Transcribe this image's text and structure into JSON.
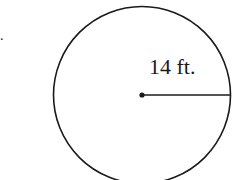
{
  "diagram": {
    "shape": "circle",
    "radius_label": "14 ft.",
    "stray_mark": ".",
    "colors": {
      "stroke": "#1a1a1a",
      "background": "#ffffff"
    }
  }
}
